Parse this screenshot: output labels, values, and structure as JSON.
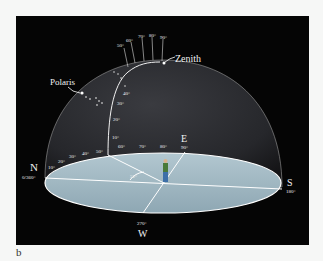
{
  "figure_label": "b",
  "labels": {
    "zenith": "Zenith",
    "polaris": "Polaris",
    "north": "N",
    "north_deg": "0/360°",
    "south": "S",
    "south_deg": "180°",
    "east": "E",
    "east_deg": "90°",
    "west": "W",
    "west_deg": "270°",
    "altitude_angle": "52°"
  },
  "azimuth_ticks": [
    "10°",
    "20°",
    "30°",
    "40°",
    "50°",
    "60°",
    "70°",
    "80°"
  ],
  "altitude_ticks_lower": [
    "10°",
    "20°",
    "30°",
    "40°"
  ],
  "altitude_ticks_upper": [
    "50°",
    "60°",
    "70°",
    "80°",
    "90°"
  ],
  "colors": {
    "background": "#050505",
    "dome": "#2b2c30",
    "ground": "#9fb6c1",
    "lines": "#f2f2f2"
  }
}
